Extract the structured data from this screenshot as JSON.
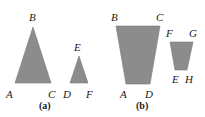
{
  "figure": {
    "colors": {
      "fill": "#8c8c8c",
      "text": "#1a1a1a",
      "background": "#ffffff"
    },
    "panels": [
      {
        "caption": "(a)",
        "shapes": [
          {
            "type": "triangle",
            "vertices": [
              {
                "label": "A",
                "x": 15,
                "y": 83
              },
              {
                "label": "B",
                "x": 33,
                "y": 27
              },
              {
                "label": "C",
                "x": 51,
                "y": 83
              }
            ]
          },
          {
            "type": "triangle",
            "vertices": [
              {
                "label": "D",
                "x": 70,
                "y": 83
              },
              {
                "label": "E",
                "x": 79,
                "y": 56
              },
              {
                "label": "F",
                "x": 88,
                "y": 83
              }
            ]
          }
        ]
      },
      {
        "caption": "(b)",
        "shapes": [
          {
            "type": "trapezoid",
            "vertices": [
              {
                "label": "B",
                "x": 116,
                "y": 26
              },
              {
                "label": "C",
                "x": 160,
                "y": 26
              },
              {
                "label": "D",
                "x": 150,
                "y": 84
              },
              {
                "label": "A",
                "x": 126,
                "y": 84
              }
            ]
          },
          {
            "type": "trapezoid",
            "vertices": [
              {
                "label": "F",
                "x": 170,
                "y": 42
              },
              {
                "label": "G",
                "x": 193,
                "y": 42
              },
              {
                "label": "H",
                "x": 187,
                "y": 70
              },
              {
                "label": "E",
                "x": 175,
                "y": 70
              }
            ]
          }
        ]
      }
    ]
  }
}
